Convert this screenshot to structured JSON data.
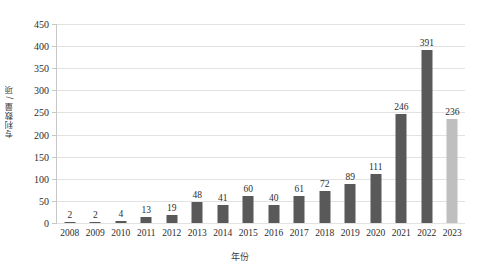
{
  "chart_data": {
    "type": "bar",
    "title": "",
    "xlabel": "年份",
    "ylabel": "专利数量 / 项",
    "categories": [
      "2008",
      "2009",
      "2010",
      "2011",
      "2012",
      "2013",
      "2014",
      "2015",
      "2016",
      "2017",
      "2018",
      "2019",
      "2020",
      "2021",
      "2022",
      "2023"
    ],
    "values": [
      2,
      2,
      4,
      13,
      19,
      48,
      41,
      60,
      40,
      61,
      72,
      89,
      111,
      246,
      391,
      236
    ],
    "series": [
      {
        "name": "专利数量",
        "values": [
          2,
          2,
          4,
          13,
          19,
          48,
          41,
          60,
          40,
          61,
          72,
          89,
          111,
          246,
          391,
          236
        ]
      }
    ],
    "ylim": [
      0,
      450
    ],
    "y_ticks": [
      0,
      50,
      100,
      150,
      200,
      250,
      300,
      350,
      400,
      450
    ],
    "y_tick_labels": [
      "0",
      "50",
      "100",
      "150",
      "200",
      "250",
      "300",
      "350",
      "400",
      "450"
    ],
    "data_labels": [
      "2",
      "2",
      "4",
      "13",
      "19",
      "48",
      "41",
      "60",
      "40",
      "61",
      "72",
      "89",
      "111",
      "246",
      "391",
      "236"
    ],
    "grid": true,
    "legend": false,
    "legend_position": "none",
    "bar_color": "#595959",
    "highlight_color": "#bfbfbf",
    "highlight_categories": [
      "2023"
    ],
    "gridline_color": "#e2e2e2",
    "axis_color": "#c8c8c8",
    "background_color": "#ffffff",
    "text_color": "#2d2d2d"
  }
}
